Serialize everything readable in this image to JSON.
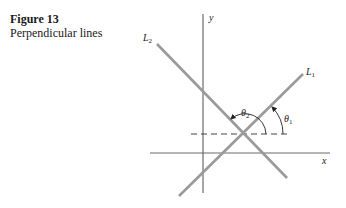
{
  "figure": {
    "number_label": "Figure 13",
    "title": "Perpendicular lines"
  },
  "diagram": {
    "axes": {
      "x_label": "x",
      "y_label": "y"
    },
    "lines": [
      {
        "name": "L1",
        "label": "L",
        "subscript": "1"
      },
      {
        "name": "L2",
        "label": "L",
        "subscript": "2"
      }
    ],
    "angles": [
      {
        "name": "theta1",
        "label": "θ",
        "subscript": "1"
      },
      {
        "name": "theta2",
        "label": "θ",
        "subscript": "2"
      }
    ],
    "colors": {
      "lines": "#9a9a9a",
      "axes": "#6b6b6b",
      "text": "#222222"
    }
  }
}
